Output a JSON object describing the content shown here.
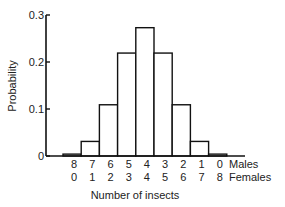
{
  "chart_data": {
    "type": "bar",
    "title": "",
    "xlabel": "Number of insects",
    "ylabel": "Probability",
    "ylim": [
      0,
      0.3
    ],
    "yticks": [
      0,
      0.1,
      0.2,
      0.3
    ],
    "ytick_labels": [
      "0",
      "0.1",
      "0.2",
      "0.3"
    ],
    "grid": false,
    "category_rows": [
      {
        "name": "Males",
        "labels": [
          "8",
          "7",
          "6",
          "5",
          "4",
          "3",
          "2",
          "1",
          "0"
        ]
      },
      {
        "name": "Females",
        "labels": [
          "0",
          "1",
          "2",
          "3",
          "4",
          "5",
          "6",
          "7",
          "8"
        ]
      }
    ],
    "categories": [
      "8M/0F",
      "7M/1F",
      "6M/2F",
      "5M/3F",
      "4M/4F",
      "3M/5F",
      "2M/6F",
      "1M/7F",
      "0M/8F"
    ],
    "values": [
      0.004,
      0.031,
      0.109,
      0.219,
      0.273,
      0.219,
      0.109,
      0.031,
      0.004
    ],
    "colors": {
      "bar_fill": "#ffffff",
      "bar_stroke": "#111111",
      "axis": "#111111"
    }
  }
}
